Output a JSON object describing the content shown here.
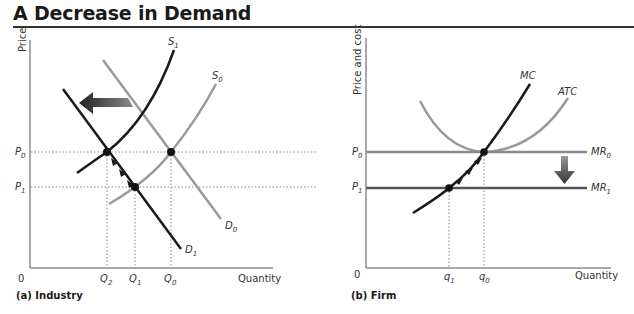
{
  "title": "A Decrease in Demand",
  "panels": [
    {
      "id": "a",
      "caption": "(a) Industry",
      "y_axis_label": "Price",
      "x_axis_label": "Quantity",
      "origin_label": "0",
      "price_ticks": [
        {
          "base": "P",
          "sub": "0"
        },
        {
          "base": "P",
          "sub": "1"
        }
      ],
      "quantity_ticks": [
        {
          "base": "Q",
          "sub": "2"
        },
        {
          "base": "Q",
          "sub": "1"
        },
        {
          "base": "Q",
          "sub": "0"
        }
      ],
      "curves": [
        {
          "name": "S1",
          "base": "S",
          "sub": "1",
          "color": "#1a1a1a"
        },
        {
          "name": "S0",
          "base": "S",
          "sub": "0",
          "color": "#9a9a9a"
        },
        {
          "name": "D0",
          "base": "D",
          "sub": "0",
          "color": "#9a9a9a"
        },
        {
          "name": "D1",
          "base": "D",
          "sub": "1",
          "color": "#1a1a1a"
        }
      ],
      "shift_arrow": "left"
    },
    {
      "id": "b",
      "caption": "(b) Firm",
      "y_axis_label": "Price and cost",
      "x_axis_label": "Quantity",
      "origin_label": "0",
      "price_ticks": [
        {
          "base": "P",
          "sub": "0"
        },
        {
          "base": "P",
          "sub": "1"
        }
      ],
      "quantity_ticks": [
        {
          "base": "q",
          "sub": "1"
        },
        {
          "base": "q",
          "sub": "0"
        }
      ],
      "curves": [
        {
          "name": "MC",
          "label": "MC",
          "color": "#1a1a1a"
        },
        {
          "name": "ATC",
          "label": "ATC",
          "color": "#9a9a9a"
        },
        {
          "name": "MR0",
          "base": "MR",
          "sub": "0",
          "color": "#8a8a8a"
        },
        {
          "name": "MR1",
          "base": "MR",
          "sub": "1",
          "color": "#555555"
        }
      ],
      "shift_arrow": "down"
    }
  ],
  "colors": {
    "dark_curve": "#1a1a1a",
    "light_curve": "#9a9a9a",
    "axis": "#555555",
    "guide": "#888888"
  }
}
